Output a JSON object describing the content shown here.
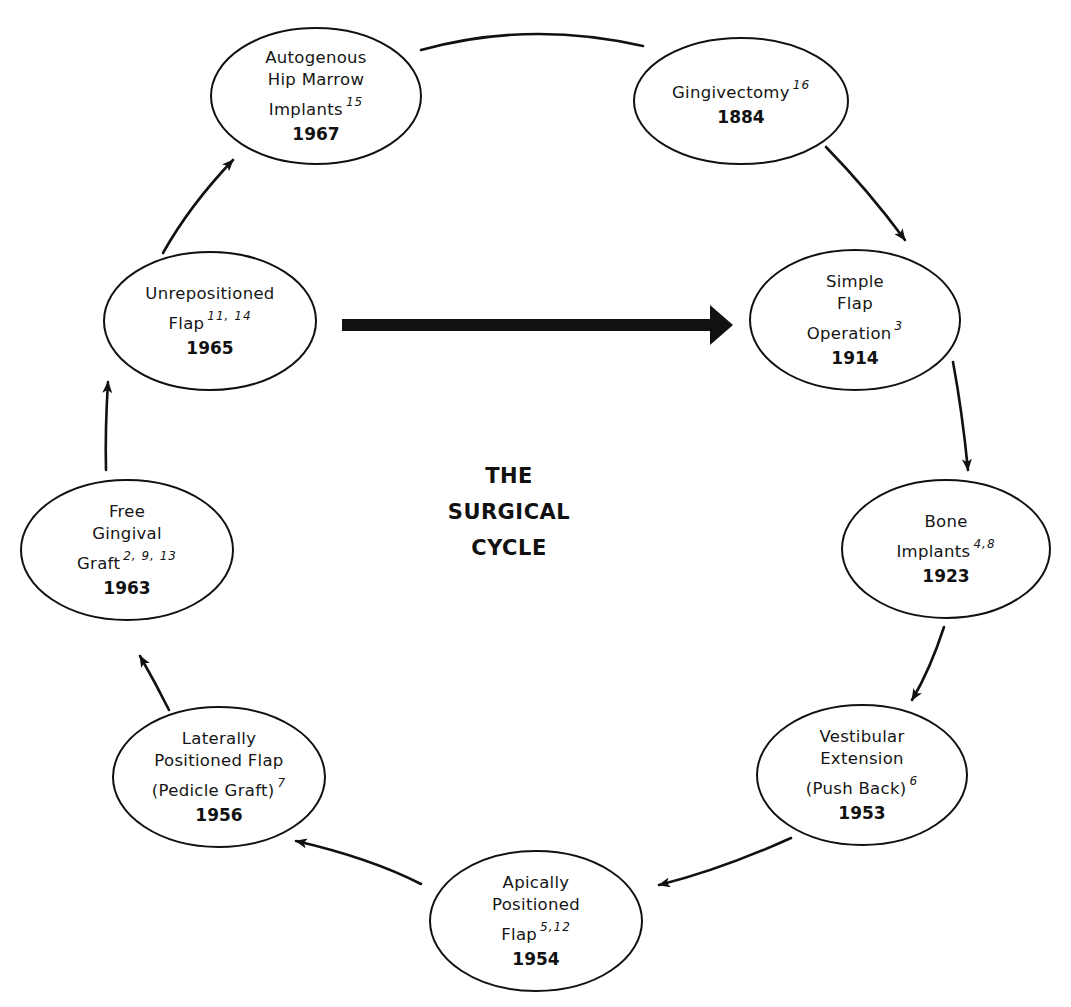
{
  "title": {
    "lines": [
      "THE",
      "SURGICAL",
      "CYCLE"
    ]
  },
  "nodes": [
    {
      "id": "gingivectomy",
      "lines": [
        "Gingivectomy"
      ],
      "sup": "16",
      "year": "1884",
      "cx": 741,
      "cy": 101,
      "rx": 107,
      "ry": 63
    },
    {
      "id": "simple-flap-operation",
      "lines": [
        "Simple",
        "Flap",
        "Operation"
      ],
      "sup": "3",
      "year": "1914",
      "cx": 855,
      "cy": 320,
      "rx": 105,
      "ry": 70
    },
    {
      "id": "bone-implants",
      "lines": [
        "Bone",
        "Implants"
      ],
      "sup": "4,8",
      "year": "1923",
      "cx": 946,
      "cy": 549,
      "rx": 104,
      "ry": 69
    },
    {
      "id": "vestibular-extension",
      "lines": [
        "Vestibular",
        "Extension",
        "(Push Back)"
      ],
      "sup": "6",
      "year": "1953",
      "cx": 862,
      "cy": 775,
      "rx": 105,
      "ry": 70
    },
    {
      "id": "apically-positioned-flap",
      "lines": [
        "Apically",
        "Positioned",
        "Flap"
      ],
      "sup": "5,12",
      "year": "1954",
      "cx": 536,
      "cy": 921,
      "rx": 106,
      "ry": 70
    },
    {
      "id": "laterally-positioned-flap",
      "lines": [
        "Laterally",
        "Positioned Flap",
        "(Pedicle Graft)"
      ],
      "sup": "7",
      "year": "1956",
      "cx": 219,
      "cy": 777,
      "rx": 106,
      "ry": 70
    },
    {
      "id": "free-gingival-graft",
      "lines": [
        "Free",
        "Gingival",
        "Graft"
      ],
      "sup": "2, 9, 13",
      "year": "1963",
      "cx": 127,
      "cy": 550,
      "rx": 106,
      "ry": 70
    },
    {
      "id": "unrepositioned-flap",
      "lines": [
        "Unrepositioned",
        "Flap"
      ],
      "sup": "11, 14",
      "year": "1965",
      "cx": 210,
      "cy": 321,
      "rx": 106,
      "ry": 69
    },
    {
      "id": "autogenous-hip-marrow-implants",
      "lines": [
        "Autogenous",
        "Hip Marrow",
        "Implants"
      ],
      "sup": "15",
      "year": "1967",
      "cx": 316,
      "cy": 96,
      "rx": 105,
      "ry": 68
    }
  ],
  "connections": [
    {
      "from": "autogenous-hip-marrow-implants",
      "to": "gingivectomy",
      "style": "plain-curve"
    },
    {
      "from": "gingivectomy",
      "to": "simple-flap-operation",
      "style": "arrow"
    },
    {
      "from": "simple-flap-operation",
      "to": "bone-implants",
      "style": "arrow"
    },
    {
      "from": "bone-implants",
      "to": "vestibular-extension",
      "style": "arrow"
    },
    {
      "from": "vestibular-extension",
      "to": "apically-positioned-flap",
      "style": "arrow"
    },
    {
      "from": "apically-positioned-flap",
      "to": "laterally-positioned-flap",
      "style": "arrow"
    },
    {
      "from": "laterally-positioned-flap",
      "to": "free-gingival-graft",
      "style": "arrow"
    },
    {
      "from": "free-gingival-graft",
      "to": "unrepositioned-flap",
      "style": "arrow"
    },
    {
      "from": "unrepositioned-flap",
      "to": "autogenous-hip-marrow-implants",
      "style": "arrow"
    },
    {
      "from": "unrepositioned-flap",
      "to": "simple-flap-operation",
      "style": "bold-arrow"
    }
  ],
  "colors": {
    "ink": "#111111",
    "background": "#ffffff"
  }
}
